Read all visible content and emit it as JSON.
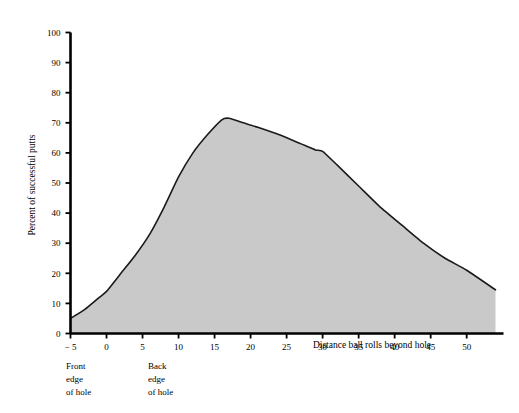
{
  "chart_data": {
    "type": "area",
    "title": "",
    "xlabel": "Distance ball rolls beyond hole",
    "ylabel": "Percent of successful putts",
    "xlim": [
      -5,
      54
    ],
    "ylim": [
      0,
      100
    ],
    "grid": false,
    "legend": null,
    "x_ticks": [
      -5,
      0,
      5,
      10,
      15,
      20,
      25,
      30,
      35,
      40,
      45,
      50
    ],
    "x_tick_labels": [
      "− 5",
      "0",
      "5",
      "10",
      "15",
      "20",
      "25",
      "30",
      "35",
      "40",
      "45",
      "50"
    ],
    "y_ticks": [
      0,
      10,
      20,
      30,
      40,
      50,
      60,
      70,
      80,
      90,
      100
    ],
    "y_tick_labels": [
      "0",
      "10",
      "20",
      "30",
      "40",
      "50",
      "60",
      "70",
      "80",
      "90",
      "100"
    ],
    "series": [
      {
        "name": "Percent of successful putts",
        "fill_color": "#c9c9c9",
        "line_color": "#1a1a1a",
        "x": [
          -5,
          -3,
          -1,
          0,
          2,
          4,
          6,
          8,
          10,
          12,
          14,
          16,
          17,
          19,
          21,
          24,
          27,
          29,
          30,
          32,
          35,
          38,
          41,
          44,
          47,
          50,
          54
        ],
        "values": [
          5,
          8,
          12,
          14,
          20,
          26,
          33,
          42,
          52,
          60,
          66,
          71,
          71.5,
          70,
          68.5,
          66,
          63,
          61,
          60.5,
          56,
          49,
          42,
          36,
          30,
          25,
          21,
          14.5
        ]
      }
    ],
    "annotations": [
      {
        "id": "front-edge",
        "x_value": -5,
        "lines": [
          "Front",
          "edge",
          "of hole"
        ]
      },
      {
        "id": "back-edge",
        "x_value": 4.3,
        "lines": [
          "Back",
          "edge",
          "of hole"
        ]
      }
    ]
  },
  "axis_titles": {
    "x": "Distance ball rolls beyond hole",
    "y": "Percent of successful putts"
  },
  "annotation_front": {
    "line1": "Front",
    "line2": "edge",
    "line3": "of hole"
  },
  "annotation_back": {
    "line1": "Back",
    "line2": "edge",
    "line3": "of hole"
  },
  "colors": {
    "fill": "#c9c9c9",
    "line": "#1a1a1a",
    "axis": "#000000",
    "background": "#ffffff"
  }
}
